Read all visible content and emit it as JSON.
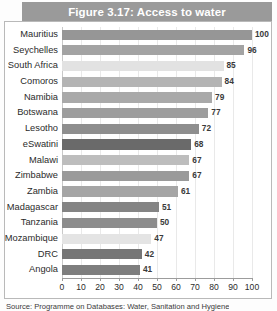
{
  "figure": {
    "title": "Figure 3.17: Access to water",
    "source_caption": "Source: Programme on Databases: Water, Sanitation and Hygiene"
  },
  "chart_data": {
    "type": "bar",
    "orientation": "horizontal",
    "title": "Figure 3.17: Access to water",
    "xlabel": "",
    "ylabel": "",
    "xlim": [
      0,
      100
    ],
    "xticks": [
      0,
      10,
      20,
      30,
      40,
      50,
      60,
      70,
      80,
      90,
      100
    ],
    "grid": true,
    "legend": "none",
    "categories": [
      "Mauritius",
      "Seychelles",
      "South Africa",
      "Comoros",
      "Namibia",
      "Botswana",
      "Lesotho",
      "eSwatini",
      "Malawi",
      "Zimbabwe",
      "Zambia",
      "Madagascar",
      "Tanzania",
      "Mozambique",
      "DRC",
      "Angola"
    ],
    "values": [
      100,
      96,
      85,
      84,
      79,
      77,
      72,
      68,
      67,
      67,
      61,
      51,
      50,
      47,
      42,
      41
    ],
    "bar_colors": [
      "#969696",
      "#a3a3a3",
      "#e2e2e2",
      "#b4b4b4",
      "#a9a9a9",
      "#9d9d9d",
      "#8e8e8e",
      "#6a6a6a",
      "#bdbdbd",
      "#9a9a9a",
      "#a5a5a5",
      "#848484",
      "#8c8c8c",
      "#e4e4e4",
      "#767676",
      "#7e7e7e"
    ]
  },
  "style": {
    "title_band_color": "#9a9a9a",
    "title_text_color": "#ffffff",
    "gridline_color": "#e9e9e9",
    "axis_color": "#9c9c9c",
    "frame_color": "#b9b9b9",
    "background": "#ffffff"
  }
}
